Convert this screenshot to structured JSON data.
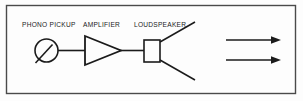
{
  "figure": {
    "background_color": "#fdfdfd",
    "line_color": "#1b1b1b",
    "text_color": "#1b1b1b",
    "border": {
      "present": true,
      "color": "#4a4a4a",
      "x": 6,
      "y": 5,
      "width": 290,
      "height": 89
    }
  },
  "labels": {
    "phono_pickup": "PHONO PICKUP",
    "amplifier": "AMPLIFIER",
    "loudspeaker": "LOUDSPEAKER"
  },
  "components": {
    "phono_pickup": {
      "name": "phono-pickup-symbol",
      "shape": "circle-with-stylus",
      "cx": 46.5,
      "cy": 50.5,
      "r": 11.5,
      "stylus": {
        "x1": 52,
        "y1": 45,
        "x2": 36,
        "y2": 63
      }
    },
    "amplifier": {
      "name": "amplifier-symbol",
      "shape": "triangle-right",
      "points": "85,36 85,65 121,50.5"
    },
    "loudspeaker": {
      "name": "loudspeaker-symbol",
      "shape": "rectangle",
      "x": 144,
      "y": 40,
      "width": 16,
      "height": 22
    }
  },
  "connections": [
    {
      "name": "wire-pickup-to-amplifier",
      "x1": 58,
      "y1": 50.5,
      "x2": 85,
      "y2": 50.5
    },
    {
      "name": "wire-amplifier-to-loudspeaker",
      "x1": 121,
      "y1": 50.5,
      "x2": 144,
      "y2": 50.5
    },
    {
      "name": "wire-loudspeaker-input-stub",
      "x1": 134,
      "y1": 50.5,
      "x2": 144,
      "y2": 50.5
    }
  ],
  "radiation_lines": [
    {
      "name": "speaker-radiation-upper",
      "x1": 160,
      "y1": 42,
      "x2": 195,
      "y2": 22
    },
    {
      "name": "speaker-radiation-lower",
      "x1": 160,
      "y1": 60,
      "x2": 195,
      "y2": 80
    }
  ],
  "arrows": [
    {
      "name": "sound-wave-arrow-upper",
      "x1": 226,
      "y1": 40,
      "x2": 281,
      "y2": 40
    },
    {
      "name": "sound-wave-arrow-lower",
      "x1": 226,
      "y1": 60,
      "x2": 281,
      "y2": 60
    }
  ],
  "label_positions": {
    "phono_pickup": {
      "x": 22,
      "y": 27
    },
    "amplifier": {
      "x": 83,
      "y": 27
    },
    "loudspeaker": {
      "x": 134,
      "y": 27
    }
  }
}
